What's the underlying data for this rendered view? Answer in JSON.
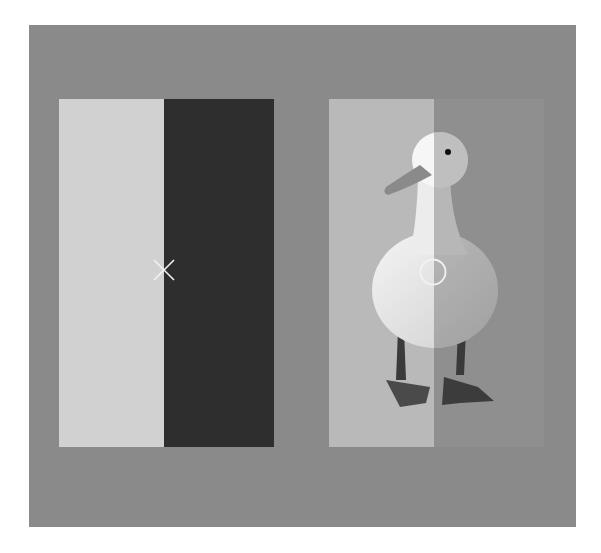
{
  "scene": {
    "description": "Two-panel lightness/contrast illusion stimulus",
    "colors": {
      "background": "#8a8a8a",
      "left_light": "#d1d1d1",
      "left_dark": "#2e2e2e",
      "right_light": "#b9b9b9",
      "right_dark": "#8f8f8f",
      "marker": "#f2f2f2"
    },
    "left_panel": {
      "marker": "x-cross",
      "halves": [
        "light",
        "dark"
      ]
    },
    "right_panel": {
      "marker": "circle",
      "subject": "white duck",
      "halves": [
        "light",
        "dark"
      ]
    }
  }
}
